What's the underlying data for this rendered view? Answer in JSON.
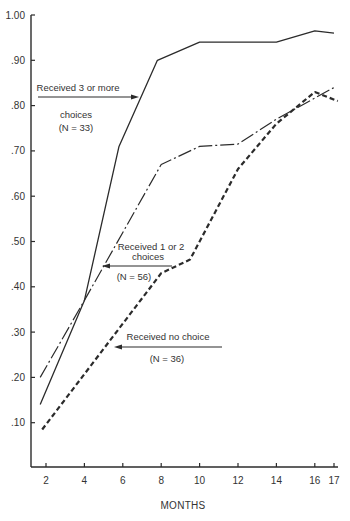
{
  "chart_data": {
    "type": "line",
    "title": "",
    "xlabel": "MONTHS",
    "ylabel": "",
    "xlim": [
      1.3,
      17.7
    ],
    "ylim": [
      0,
      1.0
    ],
    "grid": false,
    "legend_position": "inline annotations with arrows",
    "x_ticks": [
      2,
      4,
      6,
      8,
      10,
      12,
      14,
      16,
      17
    ],
    "x_tick_labels": [
      "2",
      "4",
      "6",
      "8",
      "10",
      "12",
      "14",
      "16",
      "17"
    ],
    "y_ticks": [
      0.1,
      0.2,
      0.3,
      0.4,
      0.5,
      0.6,
      0.7,
      0.8,
      0.9,
      1.0
    ],
    "y_tick_labels": [
      ".10",
      ".20",
      ".30",
      ".40",
      ".50",
      ".60",
      ".70",
      ".80",
      ".90",
      "1.00"
    ],
    "series": [
      {
        "name": "Received 3 or more choices (N=33)",
        "style": "solid",
        "x": [
          1.7,
          4,
          5.8,
          7.8,
          10,
          14,
          16,
          17
        ],
        "values": [
          0.14,
          0.37,
          0.71,
          0.9,
          0.94,
          0.94,
          0.965,
          0.96
        ]
      },
      {
        "name": "Received 1 or 2 choices (N=56)",
        "style": "dash-dot",
        "x": [
          1.7,
          4,
          8,
          10,
          12,
          14,
          17
        ],
        "values": [
          0.2,
          0.37,
          0.67,
          0.71,
          0.715,
          0.77,
          0.84
        ]
      },
      {
        "name": "Received no choice (N=36)",
        "style": "dashed",
        "x": [
          1.8,
          8,
          9.5,
          12,
          14,
          16,
          17.2
        ],
        "values": [
          0.085,
          0.43,
          0.46,
          0.66,
          0.76,
          0.83,
          0.81
        ]
      }
    ],
    "annotations": [
      {
        "line1": "Received 3 or more",
        "line2": "choices",
        "line3": "(N = 33)"
      },
      {
        "line1": "Received 1 or 2",
        "line2": "choices",
        "line3": "(N = 56)"
      },
      {
        "line1": "Received no choice",
        "line2": "",
        "line3": "(N = 36)"
      }
    ]
  }
}
